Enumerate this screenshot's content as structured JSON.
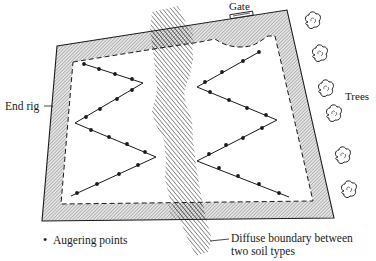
{
  "figure": {
    "type": "field-sampling-diagram",
    "labels": {
      "gate": "Gate",
      "end_rig": "End rig",
      "trees": "Trees",
      "legend_augering": "Augering points",
      "boundary_line1": "Diffuse boundary between",
      "boundary_line2": "two soil types"
    },
    "legend_bullet": "•",
    "colors": {
      "ink": "#1a1a1a",
      "headland_fill": "#cfcfcf",
      "background": "#ffffff"
    }
  }
}
